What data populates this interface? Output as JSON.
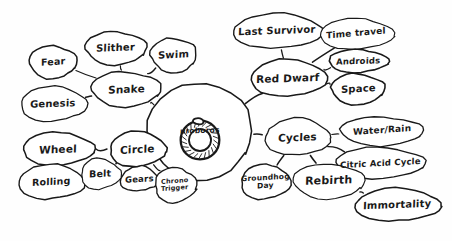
{
  "diagram": {
    "type": "mind-map",
    "title": "uroboros",
    "style": "hand-drawn sketch, black ink on white paper",
    "center": {
      "id": "uroboros",
      "label": "uroboros",
      "icon": "ouroboros-snake-eating-tail",
      "x": 200,
      "y": 131,
      "rx": 52,
      "ry": 48
    },
    "nodes": [
      {
        "id": "snake",
        "label": "Snake",
        "x": 126,
        "y": 89,
        "rx": 35,
        "ry": 17,
        "fontSize": 10.5,
        "rot": -2
      },
      {
        "id": "fear",
        "label": "Fear",
        "x": 53,
        "y": 62,
        "rx": 24,
        "ry": 16,
        "fontSize": 9.5,
        "rot": -4
      },
      {
        "id": "slither",
        "label": "Slither",
        "x": 116,
        "y": 48,
        "rx": 31,
        "ry": 16,
        "fontSize": 10,
        "rot": -2
      },
      {
        "id": "swim",
        "label": "Swim",
        "x": 174,
        "y": 55,
        "rx": 23,
        "ry": 17,
        "fontSize": 10,
        "rot": -3
      },
      {
        "id": "genesis",
        "label": "Genesis",
        "x": 53,
        "y": 104,
        "rx": 33,
        "ry": 17,
        "fontSize": 10,
        "rot": -2
      },
      {
        "id": "circle",
        "label": "Circle",
        "x": 137,
        "y": 149,
        "rx": 28,
        "ry": 17,
        "fontSize": 10.5,
        "rot": -3
      },
      {
        "id": "wheel",
        "label": "Wheel",
        "x": 58,
        "y": 149,
        "rx": 36,
        "ry": 16,
        "fontSize": 10.5,
        "rot": -2
      },
      {
        "id": "rolling",
        "label": "Rolling",
        "x": 51,
        "y": 182,
        "rx": 33,
        "ry": 17,
        "fontSize": 9.5,
        "rot": -3
      },
      {
        "id": "belt",
        "label": "Belt",
        "x": 100,
        "y": 174,
        "rx": 20,
        "ry": 15,
        "fontSize": 9.5,
        "rot": -3
      },
      {
        "id": "gears",
        "label": "Gears",
        "x": 139,
        "y": 179,
        "rx": 19,
        "ry": 12,
        "fontSize": 8.5,
        "rot": -3
      },
      {
        "id": "chrono-trigger",
        "label": "Chrono\nTrigger",
        "x": 175,
        "y": 185,
        "rx": 21,
        "ry": 17,
        "fontSize": 6.5,
        "rot": -4
      },
      {
        "id": "red-dwarf",
        "label": "Red Dwarf",
        "x": 288,
        "y": 78,
        "rx": 38,
        "ry": 18,
        "fontSize": 10.5,
        "rot": -2
      },
      {
        "id": "last-survivor",
        "label": "Last Survivor",
        "x": 277,
        "y": 31,
        "rx": 45,
        "ry": 17,
        "fontSize": 10,
        "rot": -2
      },
      {
        "id": "time-travel",
        "label": "Time travel",
        "x": 356,
        "y": 34,
        "rx": 37,
        "ry": 15,
        "fontSize": 9,
        "rot": -5
      },
      {
        "id": "androids",
        "label": "Androids",
        "x": 358,
        "y": 61,
        "rx": 30,
        "ry": 11,
        "fontSize": 8.5,
        "rot": -2
      },
      {
        "id": "space",
        "label": "Space",
        "x": 358,
        "y": 89,
        "rx": 27,
        "ry": 15,
        "fontSize": 10,
        "rot": -3
      },
      {
        "id": "cycles",
        "label": "Cycles",
        "x": 297,
        "y": 137,
        "rx": 33,
        "ry": 18,
        "fontSize": 10.5,
        "rot": -2
      },
      {
        "id": "water-rain",
        "label": "Water/Rain",
        "x": 382,
        "y": 131,
        "rx": 42,
        "ry": 14,
        "fontSize": 9,
        "rot": -4
      },
      {
        "id": "citric-acid",
        "label": "Citric Acid Cycle",
        "x": 380,
        "y": 163,
        "rx": 45,
        "ry": 15,
        "fontSize": 8.5,
        "rot": -3
      },
      {
        "id": "groundhog-day",
        "label": "Groundhog\nDay",
        "x": 265,
        "y": 182,
        "rx": 25,
        "ry": 17,
        "fontSize": 7.5,
        "rot": -3
      },
      {
        "id": "rebirth",
        "label": "Rebirth",
        "x": 329,
        "y": 181,
        "rx": 36,
        "ry": 17,
        "fontSize": 11,
        "rot": -2
      },
      {
        "id": "immortality",
        "label": "Immortality",
        "x": 397,
        "y": 205,
        "rx": 43,
        "ry": 16,
        "fontSize": 10,
        "rot": -2
      }
    ],
    "edges": [
      {
        "from": "uroboros",
        "to": "snake"
      },
      {
        "from": "snake",
        "to": "fear"
      },
      {
        "from": "snake",
        "to": "slither"
      },
      {
        "from": "snake",
        "to": "swim"
      },
      {
        "from": "snake",
        "to": "genesis"
      },
      {
        "from": "uroboros",
        "to": "circle"
      },
      {
        "from": "circle",
        "to": "wheel"
      },
      {
        "from": "wheel",
        "to": "rolling"
      },
      {
        "from": "circle",
        "to": "belt"
      },
      {
        "from": "circle",
        "to": "gears"
      },
      {
        "from": "circle",
        "to": "chrono-trigger"
      },
      {
        "from": "uroboros",
        "to": "red-dwarf"
      },
      {
        "from": "red-dwarf",
        "to": "last-survivor"
      },
      {
        "from": "red-dwarf",
        "to": "time-travel"
      },
      {
        "from": "red-dwarf",
        "to": "androids"
      },
      {
        "from": "red-dwarf",
        "to": "space"
      },
      {
        "from": "uroboros",
        "to": "cycles"
      },
      {
        "from": "cycles",
        "to": "water-rain"
      },
      {
        "from": "cycles",
        "to": "citric-acid"
      },
      {
        "from": "cycles",
        "to": "groundhog-day"
      },
      {
        "from": "cycles",
        "to": "rebirth"
      },
      {
        "from": "rebirth",
        "to": "immortality"
      }
    ],
    "colors": {
      "ink": "#191919",
      "paper": "#fefefe"
    }
  }
}
